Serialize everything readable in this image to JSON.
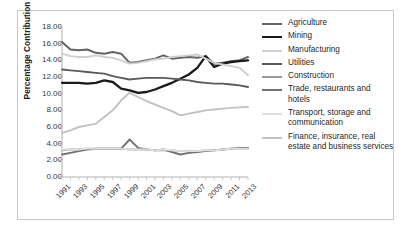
{
  "chart_data": {
    "type": "line",
    "title": "",
    "xlabel": "",
    "ylabel": "Percentage Contribution",
    "ylim": [
      0,
      18
    ],
    "ytick_step": 2,
    "ytick_labels": [
      "0.00",
      "2.00",
      "4.00",
      "6.00",
      "8.00",
      "10.00",
      "12.00",
      "14.00",
      "16.00",
      "18.00"
    ],
    "x": [
      1991,
      1992,
      1993,
      1994,
      1995,
      1996,
      1997,
      1998,
      1999,
      2000,
      2001,
      2002,
      2003,
      2004,
      2005,
      2006,
      2007,
      2008,
      2009,
      2010,
      2011,
      2012,
      2013
    ],
    "xtick_labels": [
      "1991",
      "1993",
      "1995",
      "1997",
      "1999",
      "2001",
      "2003",
      "2005",
      "2007",
      "2009",
      "2011",
      "2013"
    ],
    "grid": false,
    "legend_position": "right",
    "series": [
      {
        "name": "Agriculture",
        "color": "#646464",
        "width": 2.0,
        "values": [
          16.2,
          15.3,
          15.2,
          15.3,
          14.9,
          14.8,
          15.0,
          14.8,
          13.7,
          13.8,
          14.0,
          14.2,
          14.6,
          14.2,
          14.3,
          14.4,
          14.3,
          14.5,
          13.6,
          13.7,
          13.9,
          14.0,
          14.4
        ]
      },
      {
        "name": "Mining",
        "color": "#1a1a1a",
        "width": 2.3,
        "values": [
          11.3,
          11.3,
          11.3,
          11.2,
          11.3,
          11.6,
          11.4,
          10.6,
          10.4,
          10.1,
          10.2,
          10.5,
          10.9,
          11.3,
          11.8,
          12.3,
          13.1,
          14.5,
          13.2,
          13.6,
          13.8,
          13.9,
          14.0
        ]
      },
      {
        "name": "Manufacturing",
        "color": "#cfcfcf",
        "width": 1.9,
        "values": [
          14.8,
          14.5,
          14.4,
          14.4,
          14.6,
          14.4,
          14.3,
          14.0,
          13.6,
          13.7,
          13.9,
          14.1,
          14.2,
          14.4,
          14.5,
          14.6,
          14.7,
          14.2,
          13.7,
          13.5,
          13.3,
          13.1,
          12.2
        ]
      },
      {
        "name": "Utilities",
        "color": "#5a5a5a",
        "width": 1.9,
        "values": [
          12.9,
          12.8,
          12.7,
          12.6,
          12.5,
          12.4,
          12.1,
          11.9,
          11.7,
          11.8,
          11.9,
          11.9,
          11.9,
          11.8,
          11.7,
          11.6,
          11.4,
          11.3,
          11.2,
          11.2,
          11.1,
          11.0,
          10.8
        ]
      },
      {
        "name": "Construction",
        "color": "#9a9a9a",
        "width": 1.8,
        "values": [
          3.2,
          3.3,
          3.3,
          3.4,
          3.4,
          3.4,
          3.4,
          3.4,
          3.3,
          3.3,
          3.3,
          3.2,
          3.2,
          3.2,
          3.1,
          3.1,
          3.1,
          3.2,
          3.2,
          3.3,
          3.4,
          3.4,
          3.4
        ]
      },
      {
        "name": "Trade, restaurants and hotels",
        "color": "#717171",
        "width": 1.9,
        "values": [
          2.7,
          2.9,
          3.1,
          3.3,
          3.4,
          3.4,
          3.4,
          3.4,
          4.5,
          3.5,
          3.3,
          3.2,
          3.3,
          3.0,
          2.7,
          2.9,
          3.0,
          3.1,
          3.2,
          3.3,
          3.4,
          3.5,
          3.5
        ]
      },
      {
        "name": "Transport, storage and communication",
        "color": "#dedede",
        "width": 1.8,
        "values": [
          3.3,
          3.3,
          3.3,
          3.4,
          3.4,
          3.4,
          3.4,
          3.4,
          3.3,
          3.3,
          3.3,
          3.2,
          3.3,
          3.2,
          3.1,
          3.1,
          3.1,
          3.2,
          3.2,
          3.3,
          3.4,
          3.4,
          3.4
        ]
      },
      {
        "name": "Finance, insurance, real estate and business services",
        "color": "#c2c2c2",
        "width": 1.9,
        "values": [
          5.3,
          5.6,
          6.0,
          6.2,
          6.4,
          7.2,
          8.0,
          9.2,
          10.1,
          9.6,
          9.1,
          8.7,
          8.3,
          7.9,
          7.4,
          7.6,
          7.8,
          8.0,
          8.1,
          8.2,
          8.3,
          8.35,
          8.4
        ]
      }
    ]
  },
  "legend": {
    "items": [
      {
        "label": "Agriculture"
      },
      {
        "label": "Mining"
      },
      {
        "label": "Manufacturing"
      },
      {
        "label": "Utilities"
      },
      {
        "label": "Construction"
      },
      {
        "label": "Trade, restaurants and hotels"
      },
      {
        "label": "Transport, storage and communication"
      },
      {
        "label": "Finance, insurance, real estate and business services"
      }
    ]
  }
}
